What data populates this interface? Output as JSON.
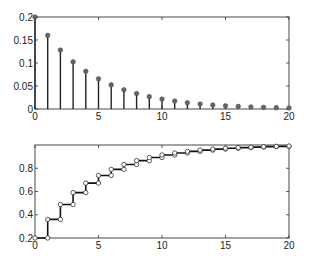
{
  "chart_data": [
    {
      "type": "stem",
      "title": "",
      "xlabel": "",
      "ylabel": "",
      "xlim": [
        0,
        20
      ],
      "ylim": [
        0,
        0.2
      ],
      "grid": false,
      "x_ticks": [
        0,
        5,
        10,
        15,
        20
      ],
      "x_tick_labels": [
        "0",
        "5",
        "10",
        "15",
        "20"
      ],
      "y_ticks": [
        0,
        0.05,
        0.1,
        0.15,
        0.2
      ],
      "y_tick_labels": [
        "0",
        "0.05",
        "0.1",
        "0.15",
        "0.2"
      ],
      "x": [
        0,
        1,
        2,
        3,
        4,
        5,
        6,
        7,
        8,
        9,
        10,
        11,
        12,
        13,
        14,
        15,
        16,
        17,
        18,
        19,
        20
      ],
      "values": [
        0.2,
        0.16,
        0.128,
        0.1024,
        0.0819,
        0.0655,
        0.0524,
        0.0419,
        0.0336,
        0.0268,
        0.0215,
        0.0172,
        0.0137,
        0.011,
        0.0088,
        0.007,
        0.0056,
        0.0045,
        0.0036,
        0.0029,
        0.0023
      ],
      "marker": "filled-circle",
      "marker_color": "#666666",
      "line_color": "#222222"
    },
    {
      "type": "line",
      "style": "staircase",
      "title": "",
      "xlabel": "",
      "ylabel": "",
      "xlim": [
        0,
        20
      ],
      "ylim": [
        0.2,
        1.0
      ],
      "grid": false,
      "x_ticks": [
        0,
        5,
        10,
        15,
        20
      ],
      "x_tick_labels": [
        "0",
        "5",
        "10",
        "15",
        "20"
      ],
      "y_ticks": [
        0.2,
        0.4,
        0.6,
        0.8
      ],
      "y_tick_labels": [
        "0.2",
        "0.4",
        "0.6",
        "0.8"
      ],
      "x": [
        0,
        1,
        2,
        3,
        4,
        5,
        6,
        7,
        8,
        9,
        10,
        11,
        12,
        13,
        14,
        15,
        16,
        17,
        18,
        19,
        20
      ],
      "values": [
        0.2,
        0.36,
        0.488,
        0.5904,
        0.6723,
        0.7379,
        0.7903,
        0.8322,
        0.8658,
        0.8926,
        0.9141,
        0.9313,
        0.945,
        0.956,
        0.9648,
        0.9719,
        0.9775,
        0.982,
        0.9856,
        0.9885,
        0.9908
      ],
      "marker": "open-circle",
      "line_color": "#111111"
    }
  ],
  "layout": {
    "top_axes": {
      "x0": 35,
      "x1": 289,
      "y_top": 17,
      "y_bottom": 109
    },
    "bottom_axes": {
      "x0": 35,
      "x1": 289,
      "y_top": 145,
      "y_bottom": 238
    }
  }
}
